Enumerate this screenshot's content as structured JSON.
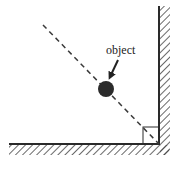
{
  "diagram": {
    "type": "physics-corner-diagram",
    "label": "object",
    "colors": {
      "stroke": "#2a2a2a",
      "ball": "#2b2b2b",
      "dash": "#3a3a3a",
      "background": "#ffffff"
    },
    "elements": {
      "floor": {
        "x1": 9,
        "y": 144,
        "x2": 160
      },
      "wall": {
        "x": 159,
        "y1": 6,
        "y2": 144
      },
      "ball": {
        "cx": 106,
        "cy": 89,
        "r": 8
      },
      "trajectory": {
        "x1": 43,
        "y1": 25,
        "x2": 159,
        "y2": 144
      },
      "right_angle_box": {
        "x": 143,
        "y": 127,
        "size": 16
      },
      "arrow": {
        "x1": 118,
        "y1": 60,
        "x2": 109,
        "y2": 79
      }
    }
  }
}
